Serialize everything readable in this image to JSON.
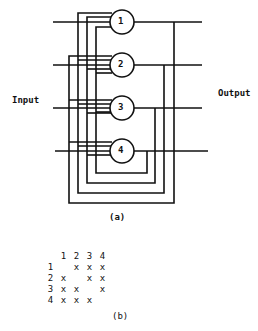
{
  "labels": {
    "input": "Input",
    "output": "Output",
    "caption_a": "(a)",
    "caption_b": "(b)"
  },
  "neurons": [
    {
      "label": "1"
    },
    {
      "label": "2"
    },
    {
      "label": "3"
    },
    {
      "label": "4"
    }
  ],
  "matrix": {
    "col_headers": [
      "1",
      "2",
      "3",
      "4"
    ],
    "rows": [
      {
        "label": "1",
        "cells": [
          "",
          "x",
          "x",
          "x"
        ]
      },
      {
        "label": "2",
        "cells": [
          "x",
          "",
          "x",
          "x"
        ]
      },
      {
        "label": "3",
        "cells": [
          "x",
          "x",
          "",
          "x"
        ]
      },
      {
        "label": "4",
        "cells": [
          "x",
          "x",
          "x",
          ""
        ]
      }
    ]
  },
  "colors": {
    "line": "#111111",
    "background": "#ffffff"
  }
}
